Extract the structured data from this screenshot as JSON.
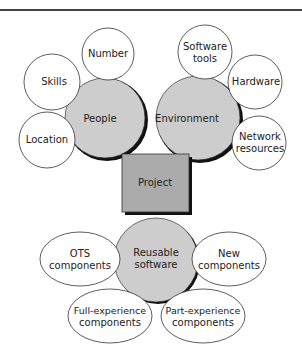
{
  "diagram": {
    "center": {
      "label": "Project"
    },
    "groups": [
      {
        "label": "People",
        "children": [
          "Number",
          "Skills",
          "Location"
        ]
      },
      {
        "label": "Environment",
        "children": [
          "Software tools",
          "Hardware",
          "Network resources"
        ]
      },
      {
        "label": "Reusable software",
        "children": [
          "OTS components",
          "New components",
          "Full-experience components",
          "Part-experience components"
        ]
      }
    ]
  },
  "labels": {
    "project": "Project",
    "people": "People",
    "number": "Number",
    "skills": "Skills",
    "location": "Location",
    "environment": "Environment",
    "software_l1": "Software",
    "software_l2": "tools",
    "hardware": "Hardware",
    "network_l1": "Network",
    "network_l2": "resources",
    "reusable_l1": "Reusable",
    "reusable_l2": "software",
    "ots_l1": "OTS",
    "ots_l2": "components",
    "new_l1": "New",
    "new_l2": "components",
    "full_l1": "Full-experience",
    "full_l2": "components",
    "part_l1": "Part-experience",
    "part_l2": "components"
  },
  "colors": {
    "hub_fill": "#c8c8c8",
    "box_fill": "#a8a8a8",
    "stroke": "#222222"
  }
}
